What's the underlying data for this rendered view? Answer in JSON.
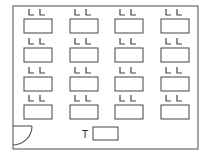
{
  "diagram": {
    "type": "classroom-floor-plan",
    "room": {
      "x": 13,
      "y": 6,
      "width": 185,
      "height": 143
    },
    "door": {
      "position": "bottom-left",
      "leaf_y": 126,
      "x": 13,
      "radius": 19
    },
    "teacher_desk": {
      "label": "T",
      "x": 93,
      "y": 127,
      "width": 25,
      "height": 13
    },
    "desk_size": {
      "width": 28,
      "height": 14
    },
    "columns_x": [
      24,
      70,
      115,
      161
    ],
    "rows_y": [
      19,
      48,
      77,
      105
    ],
    "chair_symbol": "L",
    "chairs_per_desk": 2,
    "student_desks": [
      {
        "row": 1,
        "col": 1,
        "chairs": "L L"
      },
      {
        "row": 1,
        "col": 2,
        "chairs": "L L"
      },
      {
        "row": 1,
        "col": 3,
        "chairs": "L L"
      },
      {
        "row": 1,
        "col": 4,
        "chairs": "L L"
      },
      {
        "row": 2,
        "col": 1,
        "chairs": "L L"
      },
      {
        "row": 2,
        "col": 2,
        "chairs": "L L"
      },
      {
        "row": 2,
        "col": 3,
        "chairs": "L L"
      },
      {
        "row": 2,
        "col": 4,
        "chairs": "L L"
      },
      {
        "row": 3,
        "col": 1,
        "chairs": "L L"
      },
      {
        "row": 3,
        "col": 2,
        "chairs": "L L"
      },
      {
        "row": 3,
        "col": 3,
        "chairs": "L L"
      },
      {
        "row": 3,
        "col": 4,
        "chairs": "L L"
      },
      {
        "row": 4,
        "col": 1,
        "chairs": "L L"
      },
      {
        "row": 4,
        "col": 2,
        "chairs": "L L"
      },
      {
        "row": 4,
        "col": 3,
        "chairs": "L L"
      },
      {
        "row": 4,
        "col": 4,
        "chairs": "L L"
      }
    ]
  }
}
